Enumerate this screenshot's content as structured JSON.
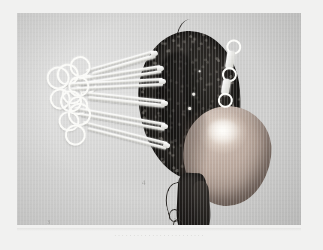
{
  "page": {
    "background_color": "#f1f1f0"
  },
  "figure": {
    "name": "surgical-specimen-photograph",
    "background_color": "#d3d3d2",
    "border_color": "#c9c9c6",
    "plate_markers": [
      {
        "id": "marker-mid",
        "label": "4"
      },
      {
        "id": "marker-corner",
        "label": "3"
      }
    ],
    "structures": [
      {
        "name": "dark-tissue-mass",
        "description": "dark mottled opened tissue mass",
        "color": "#2a2724"
      },
      {
        "name": "pale-organ-lobe",
        "description": "pale pink-tan rounded lobe with specular highlight",
        "color": "#b9a79c"
      },
      {
        "name": "pedicle-stump",
        "description": "dark pedicle and vessel stump hanging below",
        "color": "#231f1d"
      },
      {
        "name": "suture-thread",
        "description": "dark suture thread extending from the top of the specimen",
        "color": "#262321"
      }
    ],
    "instruments": {
      "name": "hemostat-clamps",
      "count": 6,
      "color": "#fbfbf8",
      "description": "ring-handled hemostatic forceps clamped along the specimen margin",
      "items": [
        {
          "id": "clamp-1",
          "left": 52,
          "top": 22,
          "rotate": -16,
          "shaft": 86,
          "ring": 17
        },
        {
          "id": "clamp-2",
          "left": 40,
          "top": 36,
          "rotate": -9,
          "shaft": 104,
          "ring": 18
        },
        {
          "id": "clamp-3",
          "left": 30,
          "top": 48,
          "rotate": -3,
          "shaft": 116,
          "ring": 19
        },
        {
          "id": "clamp-4",
          "left": 50,
          "top": 72,
          "rotate": 6,
          "shaft": 98,
          "ring": 17
        },
        {
          "id": "clamp-5",
          "left": 40,
          "top": 94,
          "rotate": 10,
          "shaft": 108,
          "ring": 18
        },
        {
          "id": "clamp-6",
          "left": 46,
          "top": 112,
          "rotate": 14,
          "shaft": 104,
          "ring": 19
        }
      ]
    },
    "secondary_instrument": {
      "name": "right-side-clip-applier",
      "color": "#ffffff"
    }
  },
  "caption": {
    "text": "· · · · · · · · · · · · · · · · · · · · · · · ·"
  }
}
